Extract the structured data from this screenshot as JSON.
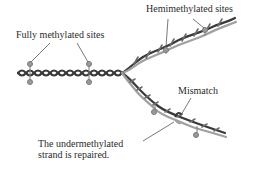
{
  "diagram": {
    "labels": {
      "fully_methylated": "Fully methylated sites",
      "hemimethylated": "Hemimethylated sites",
      "mismatch": "Mismatch",
      "undermethylated_line1": "The undermethylated",
      "undermethylated_line2": "strand is repaired."
    },
    "colors": {
      "parental_strand": "#3a3a3a",
      "new_strand": "#a0a0a0",
      "methyl_group": "#9a9a9a",
      "leader_line": "#555555",
      "text": "#2b2b2b"
    }
  }
}
